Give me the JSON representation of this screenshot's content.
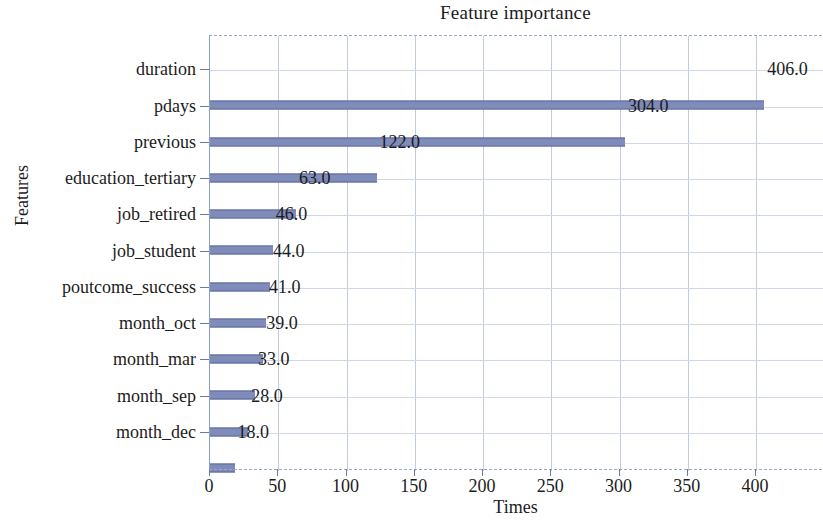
{
  "chart_data": {
    "type": "bar",
    "orientation": "horizontal",
    "title": "Feature importance",
    "xlabel": "Times",
    "ylabel": "Features",
    "categories": [
      "duration",
      "pdays",
      "previous",
      "education_tertiary",
      "job_retired",
      "job_student",
      "poutcome_success",
      "month_oct",
      "month_mar",
      "month_sep",
      "month_dec"
    ],
    "values": [
      406,
      304,
      122,
      63,
      46,
      44,
      41,
      39,
      33,
      28,
      18
    ],
    "value_labels": [
      "406.0",
      "304.0",
      "122.0",
      "63.0",
      "46.0",
      "44.0",
      "41.0",
      "39.0",
      "33.0",
      "28.0",
      "18.0"
    ],
    "xticks": [
      0,
      50,
      100,
      150,
      200,
      250,
      300,
      350,
      400
    ],
    "xtick_labels": [
      "0",
      "50",
      "100",
      "150",
      "200",
      "250",
      "300",
      "350",
      "400"
    ],
    "xlim": [
      0,
      449
    ],
    "grid": true,
    "legend": null,
    "bar_color": "#7f8bb8",
    "grid_color": "#c3cbdf",
    "axis_color": "#8d9ec4",
    "background_color": "#ffffff"
  }
}
